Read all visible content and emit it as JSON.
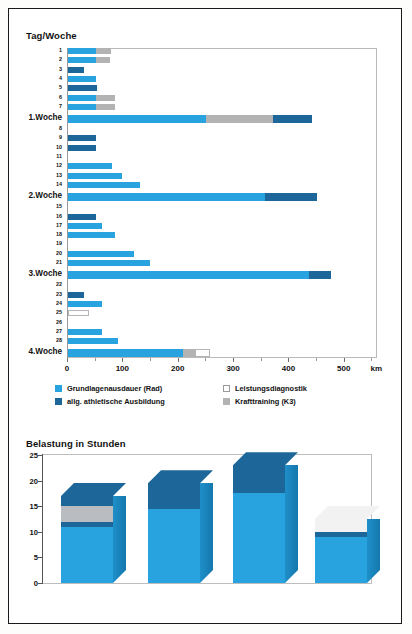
{
  "page": {
    "background": "#ffffff",
    "border_color": "#1a1a1a"
  },
  "colors": {
    "grundlagenausdauer": "#29a3e0",
    "athletische": "#1c6699",
    "krafttraining": "#b3b3b3",
    "leistungsdiagnostik": "#ffffff",
    "axis": "#555555",
    "frame": "#bdbdbd"
  },
  "top_chart": {
    "title": "Tag/Woche",
    "x_unit": "km",
    "x_ticks": [
      0,
      100,
      200,
      300,
      400,
      500
    ],
    "x_minor_step": 50,
    "x_max": 560
  },
  "legend": {
    "items": [
      {
        "label": "Grundlagenausdauer (Rad)",
        "key": "glb"
      },
      {
        "label": "allg. athletische Ausbildung",
        "key": "ath"
      },
      {
        "label": "Leistungsdiagnostik",
        "key": "diag"
      },
      {
        "label": "Krafttraining (K3)",
        "key": "kraft"
      }
    ]
  },
  "bottom_chart": {
    "title": "Belastung in Stunden",
    "y_ticks": [
      0,
      5,
      10,
      15,
      20,
      25
    ],
    "y_max": 25
  },
  "chart_data": [
    {
      "type": "bar",
      "orientation": "horizontal",
      "title": "Tag/Woche",
      "xlabel": "km",
      "ylabel": "Tag/Woche",
      "xlim": [
        0,
        560
      ],
      "x_ticks": [
        0,
        100,
        200,
        300,
        400,
        500
      ],
      "grid": false,
      "legend_position": "below",
      "series": [
        {
          "name": "Grundlagenausdauer (Rad)",
          "color": "#29a3e0"
        },
        {
          "name": "allg. athletische Ausbildung",
          "color": "#1c6699"
        },
        {
          "name": "Leistungsdiagnostik",
          "color": "#ffffff"
        },
        {
          "name": "Krafttraining (K3)",
          "color": "#b3b3b3"
        }
      ],
      "categories": [
        "1",
        "2",
        "3",
        "4",
        "5",
        "6",
        "7",
        "1.Woche",
        "8",
        "9",
        "10",
        "11",
        "12",
        "13",
        "14",
        "2.Woche",
        "15",
        "16",
        "17",
        "18",
        "19",
        "20",
        "21",
        "3.Woche",
        "22",
        "23",
        "24",
        "25",
        "26",
        "27",
        "28",
        "4.Woche"
      ],
      "rows": [
        {
          "label": "1",
          "week": false,
          "glb": 50,
          "ath": 0,
          "kraft": 28,
          "diag": 0
        },
        {
          "label": "2",
          "week": false,
          "glb": 50,
          "ath": 0,
          "kraft": 25,
          "diag": 0
        },
        {
          "label": "3",
          "week": false,
          "glb": 0,
          "ath": 28,
          "kraft": 0,
          "diag": 0
        },
        {
          "label": "4",
          "week": false,
          "glb": 50,
          "ath": 0,
          "kraft": 0,
          "diag": 0
        },
        {
          "label": "5",
          "week": false,
          "glb": 0,
          "ath": 53,
          "kraft": 0,
          "diag": 0
        },
        {
          "label": "6",
          "week": false,
          "glb": 50,
          "ath": 0,
          "kraft": 35,
          "diag": 0
        },
        {
          "label": "7",
          "week": false,
          "glb": 50,
          "ath": 0,
          "kraft": 35,
          "diag": 0
        },
        {
          "label": "1.Woche",
          "week": true,
          "glb": 250,
          "ath": 0,
          "kraft": 120,
          "diag": 0,
          "ath_after": 70
        },
        {
          "label": "8",
          "week": false,
          "glb": 0,
          "ath": 0,
          "kraft": 0,
          "diag": 0
        },
        {
          "label": "9",
          "week": false,
          "glb": 0,
          "ath": 50,
          "kraft": 0,
          "diag": 0
        },
        {
          "label": "10",
          "week": false,
          "glb": 0,
          "ath": 50,
          "kraft": 0,
          "diag": 0
        },
        {
          "label": "11",
          "week": false,
          "glb": 0,
          "ath": 0,
          "kraft": 0,
          "diag": 0
        },
        {
          "label": "12",
          "week": false,
          "glb": 80,
          "ath": 0,
          "kraft": 0,
          "diag": 0
        },
        {
          "label": "13",
          "week": false,
          "glb": 97,
          "ath": 0,
          "kraft": 0,
          "diag": 0
        },
        {
          "label": "14",
          "week": false,
          "glb": 130,
          "ath": 0,
          "kraft": 0,
          "diag": 0
        },
        {
          "label": "2.Woche",
          "week": true,
          "glb": 355,
          "ath": 95,
          "kraft": 0,
          "diag": 0
        },
        {
          "label": "15",
          "week": false,
          "glb": 0,
          "ath": 0,
          "kraft": 0,
          "diag": 0
        },
        {
          "label": "16",
          "week": false,
          "glb": 0,
          "ath": 50,
          "kraft": 0,
          "diag": 0
        },
        {
          "label": "17",
          "week": false,
          "glb": 62,
          "ath": 0,
          "kraft": 0,
          "diag": 0
        },
        {
          "label": "18",
          "week": false,
          "glb": 85,
          "ath": 0,
          "kraft": 0,
          "diag": 0
        },
        {
          "label": "19",
          "week": false,
          "glb": 0,
          "ath": 0,
          "kraft": 0,
          "diag": 0
        },
        {
          "label": "20",
          "week": false,
          "glb": 120,
          "ath": 0,
          "kraft": 0,
          "diag": 0
        },
        {
          "label": "21",
          "week": false,
          "glb": 148,
          "ath": 0,
          "kraft": 0,
          "diag": 0
        },
        {
          "label": "3.Woche",
          "week": true,
          "glb": 435,
          "ath": 40,
          "kraft": 0,
          "diag": 0
        },
        {
          "label": "22",
          "week": false,
          "glb": 0,
          "ath": 0,
          "kraft": 0,
          "diag": 0
        },
        {
          "label": "23",
          "week": false,
          "glb": 0,
          "ath": 28,
          "kraft": 0,
          "diag": 0
        },
        {
          "label": "24",
          "week": false,
          "glb": 62,
          "ath": 0,
          "kraft": 0,
          "diag": 0
        },
        {
          "label": "25",
          "week": false,
          "glb": 0,
          "ath": 0,
          "kraft": 0,
          "diag": 38
        },
        {
          "label": "26",
          "week": false,
          "glb": 0,
          "ath": 0,
          "kraft": 0,
          "diag": 0
        },
        {
          "label": "27",
          "week": false,
          "glb": 62,
          "ath": 0,
          "kraft": 0,
          "diag": 0
        },
        {
          "label": "28",
          "week": false,
          "glb": 90,
          "ath": 0,
          "kraft": 0,
          "diag": 0
        },
        {
          "label": "4.Woche",
          "week": true,
          "glb": 207,
          "ath": 0,
          "kraft": 22,
          "diag": 28
        }
      ]
    },
    {
      "type": "bar",
      "orientation": "vertical",
      "style": "3d-stacked",
      "title": "Belastung in Stunden",
      "xlabel": "",
      "ylabel": "Stunden",
      "ylim": [
        0,
        25
      ],
      "y_ticks": [
        0,
        5,
        10,
        15,
        20,
        25
      ],
      "grid": false,
      "categories": [
        "1.Woche",
        "2.Woche",
        "3.Woche",
        "4.Woche"
      ],
      "series": [
        {
          "name": "Grundlagenausdauer (Rad)",
          "color": "#29a3e0",
          "values": [
            11,
            14.5,
            17.5,
            9
          ]
        },
        {
          "name": "allg. athletische Ausbildung",
          "color": "#1c6699",
          "values": [
            1,
            5,
            5.5,
            1
          ]
        },
        {
          "name": "Krafttraining (K3)",
          "color": "#b9bcc0",
          "values": [
            3,
            0,
            0,
            0
          ]
        },
        {
          "name": "Leistungsdiagnostik",
          "color": "#f2f2f2",
          "values": [
            0,
            0,
            0,
            2.5
          ]
        },
        {
          "name": "allg. athletische Ausbildung (oben)",
          "color": "#1c6699",
          "values": [
            2,
            0,
            0,
            0
          ]
        }
      ],
      "totals": [
        17,
        19.5,
        23,
        12.5
      ]
    }
  ]
}
